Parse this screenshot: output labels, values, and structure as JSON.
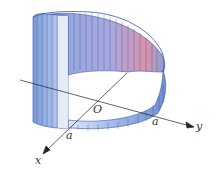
{
  "figure": {
    "labels": {
      "origin": "O",
      "x_axis": "x",
      "y_axis": "y",
      "a_on_x": "a",
      "a_on_y": "a"
    },
    "colors": {
      "surface_blue": "#7f9fd8",
      "surface_light": "#dbe6f7",
      "surface_red": "#d9879a",
      "rule_line": "#3a55a8",
      "axis": "#222222"
    }
  }
}
